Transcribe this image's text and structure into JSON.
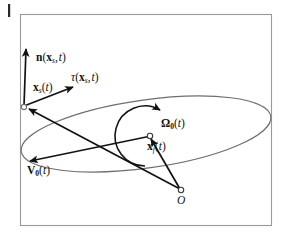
{
  "figure": {
    "frame": {
      "x": 20,
      "y": 14,
      "width": 252,
      "height": 212,
      "stroke_color": "#9a9a9a"
    },
    "margin_tick": {
      "x": 8,
      "y": 4,
      "width": 2,
      "height": 13,
      "color": "#2a2a2a"
    },
    "colors": {
      "ink": "#121212",
      "curve": "#6e6e6e",
      "frame": "#9a9a9a",
      "background": "#ffffff"
    },
    "domain_boundary": {
      "shape": "ellipse",
      "name": "fluid-domain-ellipse",
      "cx": 146,
      "cy": 134,
      "rx": 126,
      "ry": 34,
      "rotation_deg": -8
    },
    "points": [
      {
        "name": "x_s",
        "label_key": "labels.x_s",
        "x": 24,
        "y": 106,
        "marker": "open-circle"
      },
      {
        "name": "x_f",
        "label_key": "labels.x_f",
        "x": 150,
        "y": 137,
        "marker": "open-circle"
      },
      {
        "name": "O",
        "label_key": "labels.origin",
        "x": 181,
        "y": 190,
        "marker": "open-circle"
      }
    ],
    "vectors": [
      {
        "name": "normal-vector",
        "label_key": "labels.normal",
        "from": [
          24,
          106
        ],
        "to": [
          26,
          48
        ]
      },
      {
        "name": "tangent-vector",
        "label_key": "labels.tangent",
        "from": [
          24,
          106
        ],
        "to": [
          74,
          86
        ]
      },
      {
        "name": "velocity-vector",
        "label_key": "labels.velocity",
        "from": [
          150,
          137
        ],
        "to": [
          29,
          162
        ]
      },
      {
        "name": "position-vector-to-xs",
        "label_key": null,
        "from": [
          181,
          190
        ],
        "to": [
          27,
          108
        ]
      },
      {
        "name": "position-vector-to-xf",
        "label_key": null,
        "from": [
          181,
          190
        ],
        "to": [
          149,
          138
        ]
      }
    ],
    "rotation_arc": {
      "name": "angular-velocity-arc",
      "label_key": "labels.angular_velocity",
      "cx": 150,
      "cy": 137,
      "r": 30,
      "start_deg": 100,
      "end_deg": 255,
      "arrowhead_at": "start"
    }
  },
  "labels": {
    "normal": {
      "main": "n",
      "arg_vec": "x",
      "arg_sub": "s",
      "arg_time": "t"
    },
    "tangent": {
      "main": "τ",
      "arg_vec": "x",
      "arg_sub": "s",
      "arg_time": "t"
    },
    "x_s": {
      "main": "x",
      "sub": "s",
      "time": "t"
    },
    "x_f": {
      "main": "x",
      "sub": "f",
      "time": "t"
    },
    "angular_velocity": {
      "main": "Ω",
      "sub": "0",
      "time": "t"
    },
    "velocity": {
      "main": "V",
      "sub": "0",
      "time": "t"
    },
    "origin": {
      "main": "O"
    },
    "text": {
      "normal_full": "n(x_s, t)",
      "tangent_full": "τ(x_s, t)",
      "xs_full": "x_s(t)",
      "xf_full": "x_f(t)",
      "omega_full": "Ω_0(t)",
      "v0_full": "V_0(t)",
      "origin_full": "O"
    },
    "glyphs": {
      "lparen": "(",
      "rparen": ")",
      "comma": ",",
      "n": "n",
      "tau": "τ",
      "x": "x",
      "s": "s",
      "f": "f",
      "zero": "0",
      "t": "t",
      "omega": "Ω",
      "V": "V",
      "O": "O"
    }
  }
}
